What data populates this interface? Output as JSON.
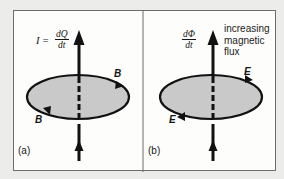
{
  "figure": {
    "panels": [
      {
        "id": "a",
        "panel_label": "(a)",
        "equation": {
          "lhs": "I =",
          "numerator": "dQ",
          "denominator": "dt"
        },
        "field_label_top": "B",
        "field_label_bottom": "B",
        "description": "current along axis produces circulating magnetic field B"
      },
      {
        "id": "b",
        "panel_label": "(b)",
        "equation": {
          "lhs": "",
          "numerator": "dΦ",
          "denominator": "dt"
        },
        "field_label_top": "E",
        "field_label_bottom": "E",
        "annotation": [
          "increasing",
          "magnetic",
          "flux"
        ],
        "description": "increasing magnetic flux along axis produces circulating electric field E"
      }
    ],
    "colors": {
      "background": "#ececea",
      "panel_fill": "#fdfdfb",
      "disc_fill": "#c9c9c9",
      "stroke": "#111111",
      "border": "#6d6d6d"
    }
  }
}
